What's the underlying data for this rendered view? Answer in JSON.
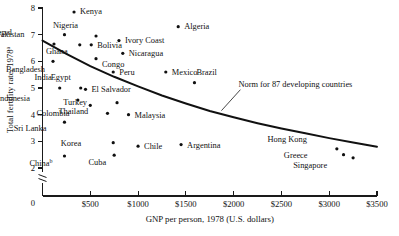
{
  "chart_data": {
    "type": "scatter",
    "title": "",
    "xlabel": "GNP per person, 1978 (U.S. dollars)",
    "ylabel": "Total fertility rate, 1978",
    "ylabel_superscript": "a",
    "xlim": [
      0,
      3500
    ],
    "ylim": [
      2,
      8
    ],
    "y_axis_break": true,
    "y_axis_break_note": "axis broken between 0 and 2",
    "grid": false,
    "legend": "none",
    "xticks": [
      0,
      500,
      1000,
      1500,
      2000,
      2500,
      3000,
      3500
    ],
    "xtick_labels": [
      "0",
      "$500",
      "$1000",
      "$1500",
      "$2000",
      "$2500",
      "$3000",
      "$3500"
    ],
    "yticks": [
      2,
      3,
      4,
      5,
      6,
      7,
      8
    ],
    "ytick_labels": [
      "2",
      "3",
      "4",
      "5",
      "6",
      "7",
      "8"
    ],
    "points": [
      {
        "name": "Nepal",
        "x": 120,
        "y": 6.65,
        "label_dx": -42,
        "label_dy": -9,
        "sup": ""
      },
      {
        "name": "Kenya",
        "x": 330,
        "y": 7.85,
        "label_dx": 6,
        "label_dy": 2,
        "sup": ""
      },
      {
        "name": "Pakistan",
        "x": 230,
        "y": 7.0,
        "label_dx": -40,
        "label_dy": 2,
        "sup": ""
      },
      {
        "name": "Nigeria",
        "x": 560,
        "y": 6.95,
        "label_dx": -18,
        "label_dy": -8,
        "sup": ""
      },
      {
        "name": "Algeria",
        "x": 1420,
        "y": 7.3,
        "label_dx": 6,
        "label_dy": 2,
        "sup": ""
      },
      {
        "name": "Ghana",
        "x": 390,
        "y": 6.62,
        "label_dx": -12,
        "label_dy": 9,
        "sup": ""
      },
      {
        "name": "Bolivia",
        "x": 510,
        "y": 6.62,
        "label_dx": 6,
        "label_dy": 3,
        "sup": ""
      },
      {
        "name": "Ivory Coast",
        "x": 800,
        "y": 6.78,
        "label_dx": 6,
        "label_dy": 2,
        "sup": ""
      },
      {
        "name": "Congo",
        "x": 560,
        "y": 6.1,
        "label_dx": 6,
        "label_dy": 8,
        "sup": ""
      },
      {
        "name": "Nicaragua",
        "x": 840,
        "y": 6.3,
        "label_dx": 6,
        "label_dy": 3,
        "sup": ""
      },
      {
        "name": "Bangladesh",
        "x": 110,
        "y": 6.0,
        "label_dx": -8,
        "label_dy": 11,
        "sup": ""
      },
      {
        "name": "Peru",
        "x": 740,
        "y": 5.6,
        "label_dx": 6,
        "label_dy": 3,
        "sup": ""
      },
      {
        "name": "Mexico",
        "x": 1290,
        "y": 5.6,
        "label_dx": 6,
        "label_dy": 3,
        "sup": ""
      },
      {
        "name": "India",
        "x": 180,
        "y": 5.0,
        "label_dx": -8,
        "label_dy": -8,
        "sup": ""
      },
      {
        "name": "Egypt",
        "x": 400,
        "y": 5.0,
        "label_dx": -10,
        "label_dy": -8,
        "sup": ""
      },
      {
        "name": "El Salvador",
        "x": 450,
        "y": 4.95,
        "label_dx": 6,
        "label_dy": 3,
        "sup": ""
      },
      {
        "name": "Brazil",
        "x": 1590,
        "y": 5.2,
        "label_dx": 2,
        "label_dy": -8,
        "sup": ""
      },
      {
        "name": "Indonesia",
        "x": 370,
        "y": 4.55,
        "label_dx": -48,
        "label_dy": 1,
        "sup": ""
      },
      {
        "name": "Thailand",
        "x": 500,
        "y": 4.35,
        "label_dx": -2,
        "label_dy": 9,
        "sup": ""
      },
      {
        "name": "Turkey",
        "x": 780,
        "y": 4.45,
        "label_dx": -30,
        "label_dy": 2,
        "sup": ""
      },
      {
        "name": "Colombia",
        "x": 680,
        "y": 4.05,
        "label_dx": -38,
        "label_dy": 3,
        "sup": ""
      },
      {
        "name": "Malaysia",
        "x": 900,
        "y": 4.0,
        "label_dx": 6,
        "label_dy": 3,
        "sup": ""
      },
      {
        "name": "Sri Lanka",
        "x": 230,
        "y": 3.72,
        "label_dx": -18,
        "label_dy": 9,
        "sup": ""
      },
      {
        "name": "Korea",
        "x": 740,
        "y": 2.95,
        "label_dx": -32,
        "label_dy": 3,
        "sup": ""
      },
      {
        "name": "Chile",
        "x": 1000,
        "y": 2.82,
        "label_dx": 6,
        "label_dy": 3,
        "sup": ""
      },
      {
        "name": "Argentina",
        "x": 1450,
        "y": 2.88,
        "label_dx": 6,
        "label_dy": 3,
        "sup": ""
      },
      {
        "name": "China",
        "x": 230,
        "y": 2.45,
        "label_dx": -12,
        "label_dy": 10,
        "sup": "b"
      },
      {
        "name": "Cuba",
        "x": 750,
        "y": 2.48,
        "label_dx": -8,
        "label_dy": 10,
        "sup": ""
      },
      {
        "name": "Hong Kong",
        "x": 3080,
        "y": 2.72,
        "label_dx": -30,
        "label_dy": -7,
        "sup": ""
      },
      {
        "name": "Greece",
        "x": 3150,
        "y": 2.5,
        "label_dx": -36,
        "label_dy": 3,
        "sup": ""
      },
      {
        "name": "Singapore",
        "x": 3250,
        "y": 2.38,
        "label_dx": -26,
        "label_dy": 10,
        "sup": ""
      }
    ],
    "norm_curve": {
      "label": "Norm for 87 developing countries",
      "x": [
        0,
        250,
        500,
        750,
        1000,
        1250,
        1500,
        1750,
        2000,
        2250,
        2500,
        2750,
        3000,
        3250,
        3500
      ],
      "y": [
        6.78,
        6.28,
        5.82,
        5.42,
        5.06,
        4.72,
        4.42,
        4.14,
        3.9,
        3.68,
        3.48,
        3.3,
        3.12,
        2.96,
        2.8
      ]
    }
  }
}
